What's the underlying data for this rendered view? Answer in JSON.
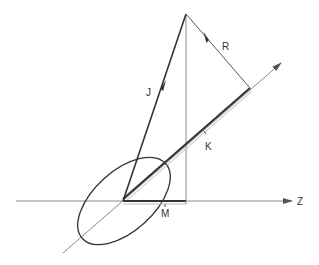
{
  "diagram": {
    "labels": {
      "J": "J",
      "R": "R",
      "K": "K",
      "M": "M",
      "Z": "Z"
    },
    "colors": {
      "background": "#ffffff",
      "thin_line": "#8a8a8a",
      "thick_line": "#333333",
      "text": "#333333"
    },
    "elements": [
      {
        "name": "z-axis",
        "type": "arrow-line",
        "label": "Z"
      },
      {
        "name": "symmetry-axis",
        "type": "arrow-line"
      },
      {
        "name": "vector-J",
        "type": "arrow",
        "label": "J"
      },
      {
        "name": "vector-R",
        "type": "arrow",
        "label": "R"
      },
      {
        "name": "projection-K",
        "type": "segment",
        "label": "K"
      },
      {
        "name": "projection-M",
        "type": "segment",
        "label": "M"
      },
      {
        "name": "precession-ellipse",
        "type": "ellipse"
      },
      {
        "name": "vertical-drop-line",
        "type": "line"
      }
    ]
  }
}
